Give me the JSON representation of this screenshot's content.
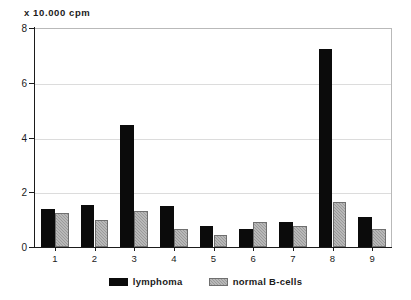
{
  "chart_data": {
    "type": "bar",
    "title": "",
    "subtitle": "",
    "xlabel": "",
    "ylabel": "x 10.000 cpm",
    "categories": [
      "1",
      "2",
      "3",
      "4",
      "5",
      "6",
      "7",
      "8",
      "9"
    ],
    "series": [
      {
        "name": "lymphoma",
        "color": "#0b0b0b",
        "values": [
          1.4,
          1.55,
          4.45,
          1.5,
          0.75,
          0.65,
          0.9,
          7.25,
          1.1
        ]
      },
      {
        "name": "normal B-cells",
        "color": "#9a9a9a",
        "values": [
          1.25,
          1.0,
          1.3,
          0.65,
          0.45,
          0.9,
          0.75,
          1.65,
          0.65
        ]
      }
    ],
    "ylim": [
      0,
      8
    ],
    "y_ticks": [
      0,
      2,
      4,
      6,
      8
    ],
    "y_tick_labels": [
      "0",
      "2",
      "4",
      "6",
      "8"
    ],
    "gridlines": "horizontal",
    "legend_position": "bottom"
  },
  "axes": {
    "y_caption": "x 10.000 cpm"
  },
  "legend": {
    "entries": [
      {
        "label": "lymphoma",
        "swatch": "black-square-swatch"
      },
      {
        "label": "normal B-cells",
        "swatch": "gray-hatched-square-swatch"
      }
    ]
  }
}
